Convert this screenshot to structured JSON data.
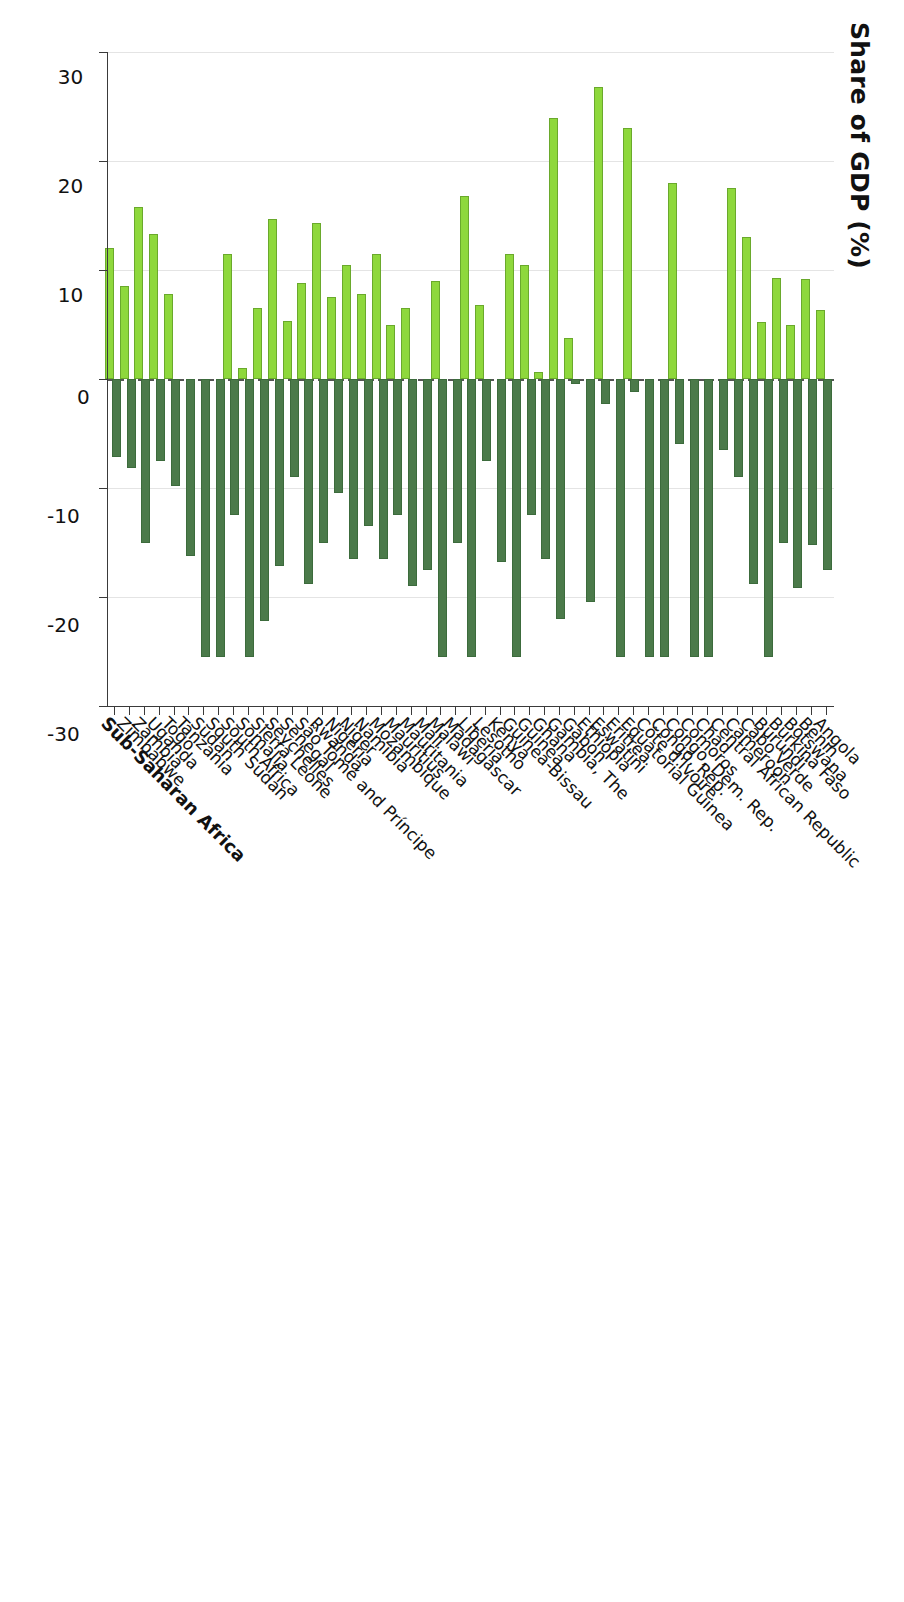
{
  "chart_data": {
    "type": "bar",
    "title": "",
    "xlabel": "",
    "ylabel": "Share of GDP (%)",
    "axis_title": "Share of GDP (%)",
    "orientation": "horizontal-diverging",
    "value_axis": {
      "ticks": [
        30,
        20,
        10,
        0,
        -10,
        -20,
        -30
      ],
      "tick_labels": [
        "30",
        "20",
        "10",
        "0",
        "-10",
        "-20",
        "-30"
      ],
      "min": -30,
      "max": 30,
      "grid": true,
      "zero_line": "dashed"
    },
    "colors": {
      "negative_series": "#4b7a4a",
      "positive_series": "#8ed83c",
      "zero_line": "#555555",
      "grid": "#e4e4e4",
      "axis": "#3a3a3a"
    },
    "series": [
      {
        "name": "negative",
        "color": "#4b7a4a"
      },
      {
        "name": "positive",
        "color": "#8ed83c"
      }
    ],
    "categories": [
      "Angola",
      "Benin",
      "Botswana",
      "Burkina Faso",
      "Burundi",
      "Cabo Verde",
      "Cameroon",
      "Central African Republic",
      "Chad",
      "Comoros",
      "Congo, Dem. Rep.",
      "Congo, Rep.",
      "Côte d'Ivoire",
      "Equatorial Guinea",
      "Eritrea",
      "Eswatini",
      "Ethiopia",
      "Gabon",
      "Gambia, The",
      "Ghana",
      "Guinea",
      "Guinea-Bissau",
      "Kenya",
      "Lesotho",
      "Liberia",
      "Madagascar",
      "Malawi",
      "Mali",
      "Mauritania",
      "Mauritius",
      "Mozambique",
      "Namibia",
      "Niger",
      "Nigeria",
      "Rwanda",
      "São Tomé and Príncipe",
      "Senegal",
      "Seychelles",
      "Sierra Leone",
      "Somalia",
      "South Africa",
      "South Sudan",
      "Sudan",
      "Tanzania",
      "Togo",
      "Uganda",
      "Zambia",
      "Zimbabwe",
      "Sub-Saharan Africa"
    ],
    "values_negative": [
      -17.5,
      -15.2,
      -19.2,
      -15.0,
      -25.5,
      -18.8,
      -9.0,
      -6.5,
      -25.5,
      -25.5,
      -6.0,
      -25.5,
      -25.5,
      -1.2,
      -25.5,
      -2.3,
      -20.5,
      -0.5,
      -22.0,
      -16.5,
      -12.5,
      -25.5,
      -16.8,
      -7.5,
      -25.5,
      -15.0,
      -25.5,
      -17.5,
      -19.0,
      -12.5,
      -16.5,
      -13.5,
      -16.5,
      -10.5,
      -15.0,
      -18.8,
      -9.0,
      -17.2,
      -22.2,
      -25.5,
      -12.5,
      -25.5,
      -25.5,
      -16.2,
      -9.8,
      -7.5,
      -15.0,
      -8.2,
      -7.2
    ],
    "values_positive": [
      6.3,
      9.2,
      5.0,
      9.3,
      5.2,
      13.0,
      17.5,
      0.0,
      0.0,
      0.0,
      18.0,
      0.0,
      0.0,
      23.0,
      0.0,
      26.8,
      0.0,
      3.8,
      23.9,
      0.6,
      10.5,
      11.5,
      0.0,
      6.8,
      16.8,
      0.0,
      9.0,
      0.0,
      6.5,
      5.0,
      11.5,
      7.8,
      10.5,
      7.5,
      14.3,
      8.8,
      5.3,
      14.7,
      6.5,
      1.0,
      11.5,
      0.0,
      0.0,
      0.0,
      7.8,
      13.3,
      15.8,
      8.5,
      12.0,
      11.8
    ],
    "bold_categories": [
      "Sub-Saharan Africa"
    ]
  }
}
